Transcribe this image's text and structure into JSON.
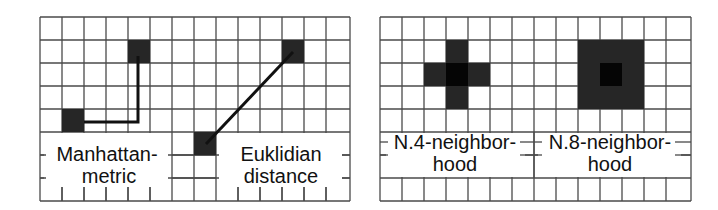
{
  "colors": {
    "background": "#ffffff",
    "grid_line": "#4a4a4a",
    "cell_fill": "#262626",
    "cell_fill_center": "#050505",
    "path_line": "#111111"
  },
  "grid": {
    "columns": 14,
    "rows": 8,
    "cell_width": 22,
    "cell_height": 23
  },
  "panels": [
    {
      "id": "distance-metrics",
      "labels": [
        {
          "line1": "Manhattan-",
          "line2": "metric"
        },
        {
          "line1": "Euklidian",
          "line2": "distance"
        }
      ]
    },
    {
      "id": "neighborhoods",
      "labels": [
        {
          "line1": "N.4-neighbor-",
          "line2": "hood"
        },
        {
          "line1": "N.8-neighbor-",
          "line2": "hood"
        }
      ]
    }
  ]
}
